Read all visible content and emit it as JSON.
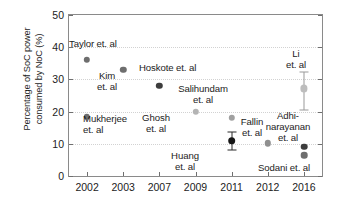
{
  "chart_data": {
    "type": "scatter",
    "title": "",
    "xlabel": "",
    "ylabel": "Percentage of SoC power consumed by NoC (%)",
    "ylabel_line1": "Percentage of SoC power",
    "ylabel_line2": "consumed by NoC (%)",
    "categories": [
      "2002",
      "2003",
      "2007",
      "2009",
      "2011",
      "2012",
      "2016"
    ],
    "xticklabels": [
      "2002",
      "2003",
      "2007",
      "2009",
      "2011",
      "2012",
      "2016"
    ],
    "yticklabels": [
      "0",
      "10",
      "20",
      "30",
      "40",
      "50"
    ],
    "yticks": [
      0,
      10,
      20,
      30,
      40,
      50
    ],
    "ylim": [
      0,
      50
    ],
    "grid": "horizontal-dotted",
    "legend": "none",
    "points": [
      {
        "name": "Taylor et. al",
        "x_category": "2002",
        "x_index": 0,
        "value": 36.0,
        "color": "#6e6e6e",
        "size": 6.4,
        "error": null
      },
      {
        "name": "Mukherjee et. al",
        "x_category": "2002",
        "x_index": 0,
        "value": 18.4,
        "color": "#6e6e6e",
        "size": 6.4,
        "error": null
      },
      {
        "name": "Kim et. al",
        "x_category": "2003",
        "x_index": 1,
        "value": 33.0,
        "color": "#6e6e6e",
        "size": 6.4,
        "error": null
      },
      {
        "name": "Hoskote et. al",
        "x_category": "2007",
        "x_index": 2,
        "value": 28.0,
        "color": "#3d3d3d",
        "size": 6.4,
        "error": null
      },
      {
        "name": "Ghosh et. al",
        "x_category": "2009",
        "x_index": 3,
        "value": 20.0,
        "color": "#b4b4b4",
        "size": 6.4,
        "error": null
      },
      {
        "name": "Salihundam et. al",
        "x_category": "2011",
        "x_index": 4,
        "value": 18.0,
        "color": "#a0a0a0",
        "size": 6.4,
        "error": null
      },
      {
        "name": "Huang et. al",
        "x_category": "2011",
        "x_index": 4,
        "value": 11.0,
        "color": "#161616",
        "size": 7.6,
        "error": {
          "low": 8.2,
          "high": 13.6
        }
      },
      {
        "name": "Fallin et. al",
        "x_category": "2012",
        "x_index": 5,
        "value": 10.2,
        "color": "#8f8f8f",
        "size": 6.4,
        "error": null
      },
      {
        "name": "Li et. al",
        "x_category": "2016",
        "x_index": 6,
        "value": 27.2,
        "color": "#bdbdbd",
        "size": 7.2,
        "error": {
          "low": 20.5,
          "high": 32.2
        }
      },
      {
        "name": "Adhinarayanan et. al",
        "x_category": "2016",
        "x_index": 6,
        "value": 9.1,
        "color": "#3d3d3d",
        "size": 6.6,
        "error": null
      },
      {
        "name": "Sodani et. al",
        "x_category": "2016",
        "x_index": 6,
        "value": 6.5,
        "color": "#6e6e6e",
        "size": 6.6,
        "error": null
      }
    ],
    "annotations": [
      {
        "id": "taylor",
        "text": "Taylor et. al",
        "left": 69,
        "top": 38,
        "align": "left"
      },
      {
        "id": "kim",
        "text": "Kim\net. al",
        "left": 107,
        "top": 70,
        "align": "center"
      },
      {
        "id": "mukherjee",
        "text": "Mukherjee\net. al",
        "left": 83,
        "top": 113,
        "align": "left"
      },
      {
        "id": "hoskote",
        "text": "Hoskote et. al",
        "left": 139,
        "top": 62,
        "align": "left"
      },
      {
        "id": "ghosh",
        "text": "Ghosh\net. al",
        "left": 156,
        "top": 112,
        "align": "center"
      },
      {
        "id": "salihundam",
        "text": "Salihundam\net. al",
        "left": 203,
        "top": 83,
        "align": "center"
      },
      {
        "id": "huang",
        "text": "Huang\net. al",
        "left": 185,
        "top": 150,
        "align": "center"
      },
      {
        "id": "fallin",
        "text": "Fallin\net. al",
        "left": 252,
        "top": 116,
        "align": "center"
      },
      {
        "id": "li",
        "text": "Li\net. al",
        "left": 296,
        "top": 48,
        "align": "center"
      },
      {
        "id": "adhinarayanan",
        "text": "Adhi-\nnarayanan\net. al",
        "left": 288,
        "top": 110,
        "align": "center"
      },
      {
        "id": "sodani",
        "text": "Sodani et. al",
        "left": 258,
        "top": 162,
        "align": "left"
      }
    ],
    "colors": {
      "frame": "#8a8a8a",
      "grid": "#d2d2d2",
      "text": "#1c1c1c",
      "background": "#ffffff"
    }
  }
}
